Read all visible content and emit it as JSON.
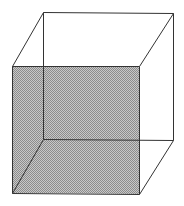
{
  "diagram": {
    "type": "wireframe-cube",
    "shaded_face": "front",
    "colors": {
      "background": "#ffffff",
      "edge": "#333333",
      "shade_dark": "#8c8c8c",
      "shade_light": "#c8c8c8"
    },
    "vertices": {
      "front_top_left": [
        12,
        66
      ],
      "front_top_right": [
        139,
        66
      ],
      "front_bottom_left": [
        12,
        193
      ],
      "front_bottom_right": [
        139,
        194
      ],
      "back_top_left": [
        43,
        12
      ],
      "back_top_right": [
        173,
        13
      ],
      "back_bottom_left": [
        43,
        139
      ],
      "back_bottom_right": [
        173,
        140
      ]
    }
  }
}
